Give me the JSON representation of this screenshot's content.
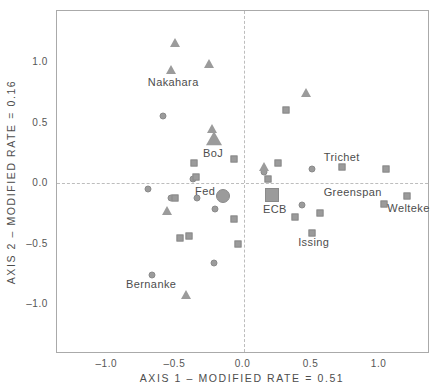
{
  "chart_data": {
    "type": "scatter",
    "title": "",
    "xlabel": "AXIS 1 – MODIFIED RATE = 0.51",
    "ylabel": "AXIS 2 – MODIFIED RATE = 0.16",
    "xlim": [
      -1.37,
      1.37
    ],
    "ylim": [
      -1.41,
      1.42
    ],
    "grid": false,
    "legend": "none",
    "marker_color": "#9b9b9b",
    "marker_edge_color": "#8a8a8a",
    "reference_lines": [
      {
        "axis": "x",
        "value": 0.0,
        "style": "dashed"
      },
      {
        "axis": "y",
        "value": 0.0,
        "style": "dashed"
      }
    ],
    "x_ticks": [
      {
        "value": -1.0,
        "label": "–1.0"
      },
      {
        "value": -0.5,
        "label": "–0.5"
      },
      {
        "value": 0.0,
        "label": "0.0"
      },
      {
        "value": 0.5,
        "label": "0.5"
      },
      {
        "value": 1.0,
        "label": "1.0"
      }
    ],
    "y_ticks": [
      {
        "value": 1.0,
        "label": "1.0"
      },
      {
        "value": 0.5,
        "label": "0.5"
      },
      {
        "value": 0.0,
        "label": "0.0"
      },
      {
        "value": -0.5,
        "label": "–0.5"
      },
      {
        "value": -1.0,
        "label": "–1.0"
      }
    ],
    "series": [
      {
        "name": "circle-markers",
        "shape": "circle",
        "points": [
          {
            "x": -0.59,
            "y": 0.55
          },
          {
            "x": -0.37,
            "y": 0.03
          },
          {
            "x": -0.7,
            "y": -0.05
          },
          {
            "x": -0.53,
            "y": -0.12
          },
          {
            "x": -0.34,
            "y": -0.12
          },
          {
            "x": -0.15,
            "y": -0.11,
            "size": "large",
            "label": "Fed"
          },
          {
            "x": -0.21,
            "y": -0.21
          },
          {
            "x": 0.15,
            "y": 0.09
          },
          {
            "x": 0.5,
            "y": 0.12
          },
          {
            "x": 0.43,
            "y": -0.18
          },
          {
            "x": -0.22,
            "y": -0.66
          },
          {
            "x": -0.67,
            "y": -0.76
          }
        ]
      },
      {
        "name": "square-markers",
        "shape": "square",
        "points": [
          {
            "x": -0.36,
            "y": 0.17
          },
          {
            "x": -0.07,
            "y": 0.2
          },
          {
            "x": -0.35,
            "y": 0.05
          },
          {
            "x": -0.5,
            "y": -0.12
          },
          {
            "x": -0.07,
            "y": -0.3
          },
          {
            "x": -0.47,
            "y": -0.45
          },
          {
            "x": -0.4,
            "y": -0.44
          },
          {
            "x": -0.04,
            "y": -0.5
          },
          {
            "x": 0.25,
            "y": 0.17
          },
          {
            "x": 0.31,
            "y": 0.6
          },
          {
            "x": 0.18,
            "y": 0.03
          },
          {
            "x": 0.21,
            "y": -0.1,
            "size": "large",
            "label": "ECB"
          },
          {
            "x": 0.72,
            "y": 0.13,
            "label": "Trichet"
          },
          {
            "x": 1.05,
            "y": 0.12
          },
          {
            "x": 0.38,
            "y": -0.28
          },
          {
            "x": 0.56,
            "y": -0.25
          },
          {
            "x": 0.5,
            "y": -0.41,
            "label": "Issing"
          },
          {
            "x": 1.03,
            "y": -0.17,
            "label": "Greenspan"
          },
          {
            "x": 1.2,
            "y": -0.11,
            "label": "Welteke"
          }
        ]
      },
      {
        "name": "triangle-markers",
        "shape": "triangle",
        "points": [
          {
            "x": -0.5,
            "y": 1.16
          },
          {
            "x": -0.53,
            "y": 0.93,
            "label": "Nakahara"
          },
          {
            "x": -0.25,
            "y": 0.98
          },
          {
            "x": -0.23,
            "y": 0.45
          },
          {
            "x": -0.22,
            "y": 0.36,
            "size": "large",
            "label": "BoJ"
          },
          {
            "x": 0.46,
            "y": 0.74
          },
          {
            "x": 0.15,
            "y": 0.13
          },
          {
            "x": -0.56,
            "y": -0.23
          },
          {
            "x": -0.42,
            "y": -0.92,
            "label": "Bernanke"
          }
        ]
      }
    ],
    "annotations": [
      {
        "text": "Nakahara",
        "x": -0.516,
        "y": 0.835
      },
      {
        "text": "BoJ",
        "x": -0.223,
        "y": 0.248
      },
      {
        "text": "Fed",
        "x": -0.282,
        "y": -0.066
      },
      {
        "text": "ECB",
        "x": 0.231,
        "y": -0.215
      },
      {
        "text": "Trichet",
        "x": 0.722,
        "y": 0.215
      },
      {
        "text": "Greenspan",
        "x": 0.802,
        "y": -0.074
      },
      {
        "text": "Welteke",
        "x": 1.212,
        "y": -0.207
      },
      {
        "text": "Issing",
        "x": 0.516,
        "y": -0.488
      },
      {
        "text": "Bernanke",
        "x": -0.678,
        "y": -0.835
      }
    ]
  }
}
